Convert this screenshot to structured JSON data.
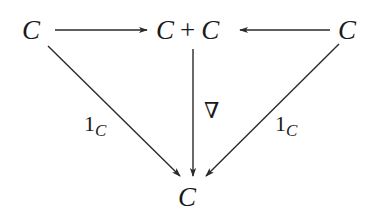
{
  "diagram": {
    "type": "commutative-diagram",
    "objects": {
      "left": "C",
      "middle_left": "C",
      "middle_op": "+",
      "middle_right": "C",
      "right": "C",
      "bottom": "C"
    },
    "morphisms": {
      "left_to_middle": "",
      "right_to_middle": "",
      "middle_to_bottom": "∇",
      "left_to_bottom_base": "1",
      "left_to_bottom_sub": "C",
      "right_to_bottom_base": "1",
      "right_to_bottom_sub": "C"
    },
    "line_color": "#2a2a2a"
  }
}
